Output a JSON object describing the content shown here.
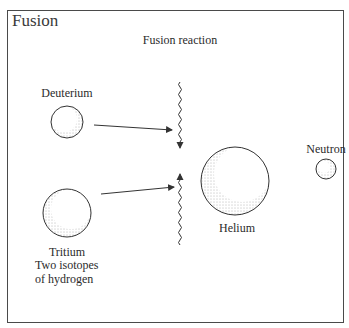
{
  "title": "Fusion",
  "labels": {
    "reaction": "Fusion reaction",
    "deuterium": "Deuterium",
    "tritium": "Tritium",
    "helium": "Helium",
    "neutron": "Neutron",
    "isotopes_line1": "Two isotopes",
    "isotopes_line2": "of hydrogen"
  },
  "particles": [
    {
      "name": "Deuterium",
      "role": "reactant"
    },
    {
      "name": "Tritium",
      "role": "reactant"
    },
    {
      "name": "Helium",
      "role": "product"
    },
    {
      "name": "Neutron",
      "role": "product"
    }
  ],
  "colors": {
    "ink": "#2b2b2b",
    "frame": "#4a4a4a",
    "background": "#ffffff"
  }
}
